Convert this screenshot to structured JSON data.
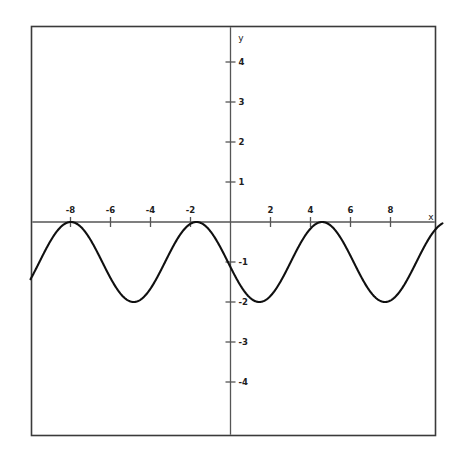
{
  "figure": {
    "background_color": "#ffffff",
    "frame_color": "#3a3a3a",
    "axis_color": "#555555",
    "curve_color": "#101010",
    "x_axis_label": "x",
    "y_axis_label": "y"
  },
  "chart_data": {
    "type": "line",
    "title": "",
    "subtitle": "",
    "xlabel": "x",
    "ylabel": "y",
    "xlim": [
      -10.0,
      10.6
    ],
    "ylim": [
      -4.85,
      4.85
    ],
    "grid": false,
    "legend": null,
    "annotations": [],
    "x_ticks": [
      -8,
      -6,
      -4,
      -2,
      2,
      4,
      6,
      8
    ],
    "x_tick_labels": [
      "-8",
      "-6",
      "-4",
      "-2",
      "2",
      "4",
      "6",
      "8"
    ],
    "y_ticks": [
      -4,
      -3,
      -2,
      -1,
      1,
      2,
      3,
      4
    ],
    "y_tick_labels": [
      "-4",
      "-3",
      "-2",
      "-1",
      "1",
      "2",
      "3",
      "4"
    ],
    "function": "y = cos(x + 1.70) - 1",
    "amplitude": 1,
    "midline": -1,
    "period": 6.2832,
    "phase_shift": -1.7,
    "y_max": 0,
    "y_min": -2,
    "maxima_x": [
      -7.98,
      -1.7,
      4.58
    ],
    "minima_x": [
      -4.84,
      1.44,
      7.72
    ],
    "series": [
      {
        "name": "y = cos(x + 1.70) - 1",
        "x": [
          -10.0,
          -9.75,
          -9.5,
          -9.25,
          -9.0,
          -8.75,
          -8.5,
          -8.25,
          -8.0,
          -7.75,
          -7.5,
          -7.25,
          -7.0,
          -6.75,
          -6.5,
          -6.25,
          -6.0,
          -5.75,
          -5.5,
          -5.25,
          -5.0,
          -4.75,
          -4.5,
          -4.25,
          -4.0,
          -3.75,
          -3.5,
          -3.25,
          -3.0,
          -2.75,
          -2.5,
          -2.25,
          -2.0,
          -1.75,
          -1.5,
          -1.25,
          -1.0,
          -0.75,
          -0.5,
          -0.25,
          0.0,
          0.25,
          0.5,
          0.75,
          1.0,
          1.25,
          1.5,
          1.75,
          2.0,
          2.25,
          2.5,
          2.75,
          3.0,
          3.25,
          3.5,
          3.75,
          4.0,
          4.25,
          4.5,
          4.75,
          5.0,
          5.25,
          5.5,
          5.75,
          6.0,
          6.25,
          6.5,
          6.75,
          7.0,
          7.25,
          7.5,
          7.75,
          8.0,
          8.25,
          8.5,
          8.75,
          9.0,
          9.25,
          9.5,
          9.75,
          10.0,
          10.25,
          10.5
        ],
        "y": [
          -1.46,
          -1.29,
          -1.14,
          -1.0,
          -0.88,
          -0.78,
          -0.7,
          -0.64,
          -0.6,
          -0.59,
          -0.6,
          -0.64,
          -0.7,
          -0.78,
          -0.88,
          -1.0,
          -1.14,
          -1.29,
          -1.44,
          -1.59,
          -1.73,
          -1.85,
          -1.93,
          -1.99,
          -2.0,
          -1.98,
          -1.93,
          -1.84,
          -1.72,
          -1.58,
          -1.43,
          -1.27,
          -1.12,
          -0.98,
          -0.85,
          -0.75,
          -0.67,
          -0.62,
          -0.6,
          -0.61,
          -0.65,
          -0.72,
          -0.81,
          -0.93,
          -1.07,
          -1.22,
          -1.37,
          -1.52,
          -1.67,
          -1.8,
          -1.9,
          -1.97,
          -2.0,
          -1.99,
          -1.95,
          -1.87,
          -1.76,
          -1.63,
          -1.48,
          -1.32,
          -1.17,
          -1.02,
          -0.89,
          -0.78,
          -0.7,
          -0.64,
          -0.61,
          -0.6,
          -0.63,
          -0.69,
          -0.77,
          -0.87,
          -0.99,
          -1.13,
          -1.27,
          -1.42,
          -1.57,
          -1.71,
          -1.84,
          -1.93,
          -1.99,
          -2.0,
          -1.98
        ]
      }
    ]
  }
}
